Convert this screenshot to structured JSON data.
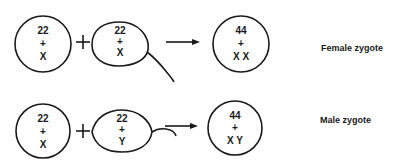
{
  "rows": [
    {
      "egg": {
        "line1": "22",
        "line2": "+",
        "line3": "X"
      },
      "operator": "+",
      "sperm": {
        "line1": "22",
        "line2": "+",
        "line3": "X"
      },
      "zygote": {
        "line1": "44",
        "line2": "+",
        "line3": "X X"
      },
      "label": "Female zygote"
    },
    {
      "egg": {
        "line1": "22",
        "line2": "+",
        "line3": "X"
      },
      "operator": "+",
      "sperm": {
        "line1": "22",
        "line2": "+",
        "line3": "Y"
      },
      "zygote": {
        "line1": "44",
        "line2": "+",
        "line3": "X Y"
      },
      "label": "Male zygote"
    }
  ]
}
